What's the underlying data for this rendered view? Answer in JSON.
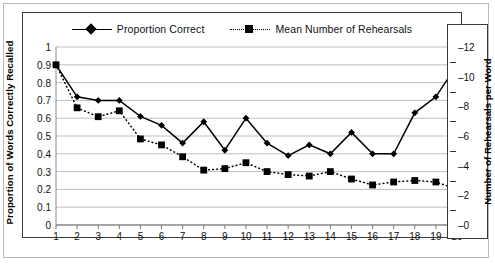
{
  "legend": {
    "items": [
      {
        "label": "Proportion Correct",
        "marker": "diamond",
        "line": "solid"
      },
      {
        "label": "Mean Number of Rehearsals",
        "marker": "square",
        "line": "dotted"
      }
    ]
  },
  "axes": {
    "left_title": "Proportion of Words Correctly Recalled",
    "right_title": "Number of Rehearsals per Word",
    "left_ticks": [
      "0",
      "0.1",
      "0.2",
      "0.3",
      "0.4",
      "0.5",
      "0.6",
      "0.7",
      "0.8",
      "0.9",
      "1"
    ],
    "right_ticks": [
      "0",
      "2",
      "4",
      "6",
      "8",
      "10",
      "12"
    ],
    "x_ticks": [
      "1",
      "2",
      "3",
      "4",
      "5",
      "6",
      "7",
      "8",
      "9",
      "10",
      "11",
      "12",
      "13",
      "14",
      "15",
      "16",
      "17",
      "18",
      "19",
      "20"
    ]
  },
  "chart_data": {
    "type": "line",
    "title": "",
    "xlabel": "",
    "ylabel": "Proportion of Words Correctly Recalled",
    "y2label": "Number of Rehearsals per Word",
    "grid": true,
    "legend_position": "top",
    "x": [
      1,
      2,
      3,
      4,
      5,
      6,
      7,
      8,
      9,
      10,
      11,
      12,
      13,
      14,
      15,
      16,
      17,
      18,
      19,
      20
    ],
    "xlim": [
      1,
      20
    ],
    "ylim": [
      0,
      1
    ],
    "y2lim": [
      0,
      12
    ],
    "series": [
      {
        "name": "Proportion Correct",
        "axis": "left",
        "marker": "diamond",
        "line": "solid",
        "color": "#000000",
        "values": [
          0.9,
          0.72,
          0.7,
          0.7,
          0.61,
          0.56,
          0.46,
          0.58,
          0.42,
          0.6,
          0.46,
          0.39,
          0.45,
          0.4,
          0.52,
          0.4,
          0.4,
          0.63,
          0.72,
          0.9
        ]
      },
      {
        "name": "Mean Number of Rehearsals",
        "axis": "right",
        "marker": "square",
        "line": "dotted",
        "color": "#000000",
        "values": [
          10.8,
          7.9,
          7.3,
          7.7,
          5.8,
          5.4,
          4.6,
          3.7,
          3.8,
          4.2,
          3.6,
          3.4,
          3.3,
          3.6,
          3.1,
          2.7,
          2.9,
          3.0,
          2.9,
          2.4
        ]
      }
    ]
  }
}
